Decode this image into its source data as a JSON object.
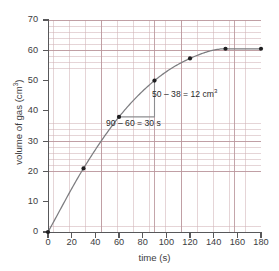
{
  "chart_data": {
    "type": "line",
    "title": "",
    "xlabel": "time (s)",
    "ylabel": "volume of gas (cm³)",
    "xlim": [
      0,
      180
    ],
    "ylim": [
      0,
      70
    ],
    "xticks": [
      0,
      20,
      40,
      60,
      80,
      100,
      120,
      140,
      160,
      180
    ],
    "yticks": [
      0,
      10,
      20,
      30,
      40,
      50,
      60,
      70
    ],
    "grid": true,
    "legend": null,
    "series": [
      {
        "name": "volume of gas",
        "x": [
          0,
          30,
          60,
          90,
          120,
          150,
          180
        ],
        "values": [
          0,
          21,
          38,
          50,
          57.3,
          60.5,
          60.5
        ],
        "marker": "filled-circle",
        "color": "#7d7d80"
      }
    ],
    "annotations": [
      {
        "name": "gradient-triangle",
        "from": [
          60,
          38
        ],
        "to": [
          90,
          50
        ],
        "corner": [
          90,
          38
        ],
        "rise_label": "50 – 38 = 12 cm³",
        "run_label": "90 – 60 = 30 s"
      }
    ]
  },
  "axes": {
    "x": {
      "title": "time (s)",
      "tick_labels": [
        "0",
        "20",
        "40",
        "60",
        "80",
        "100",
        "120",
        "140",
        "160",
        "180"
      ]
    },
    "y": {
      "title_text": "volume of gas (cm",
      "title_sup": "3",
      "title_tail": ")",
      "tick_labels": [
        "0",
        "10",
        "20",
        "30",
        "40",
        "50",
        "60",
        "70"
      ]
    }
  },
  "annotations": {
    "rise_prefix": "50 – 38 = 12 cm",
    "rise_sup": "3",
    "run": "90 – 60 = 30 s"
  },
  "colors": {
    "curve": "#7d7d80",
    "marker": "#1f1f21",
    "axis": "#58585a",
    "grid_minor": "#d0b2b6",
    "grid_major": "#ba969c",
    "triangle": "#8d8d90",
    "text": "#3c3c3e",
    "background": "#ffffff"
  }
}
